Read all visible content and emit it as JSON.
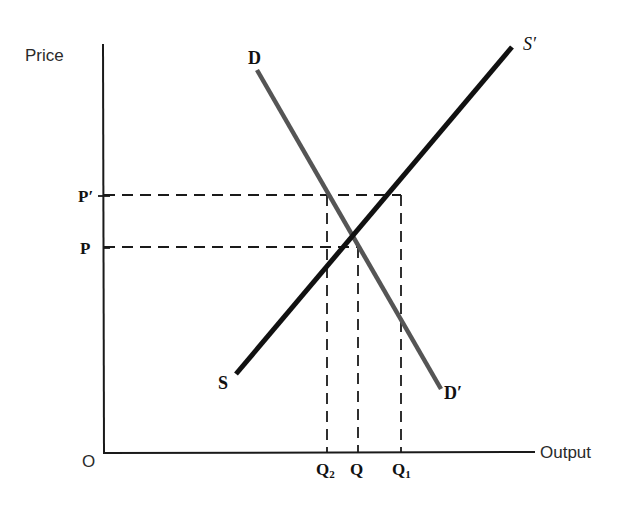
{
  "diagram": {
    "title": "",
    "axes": {
      "y_label": "Price",
      "x_label": "Output",
      "origin_label": "O"
    },
    "price_levels": [
      {
        "id": "p_prime",
        "label": "P′",
        "y": 195
      },
      {
        "id": "p",
        "label": "P",
        "y": 247
      }
    ],
    "quantity_levels": [
      {
        "id": "q2",
        "label": "Q",
        "subscript": "2",
        "x": 327
      },
      {
        "id": "q",
        "label": "Q",
        "subscript": "",
        "x": 358
      },
      {
        "id": "q1",
        "label": "Q",
        "subscript": "1",
        "x": 401
      }
    ],
    "curves": {
      "demand": {
        "start_label": "D",
        "end_label": "D′",
        "color": "#555555"
      },
      "supply": {
        "start_label": "S",
        "end_label": "S′",
        "color": "#111111"
      }
    },
    "equilibrium": {
      "price": "P",
      "quantity": "Q"
    },
    "colors": {
      "axis": "#1a1a1a",
      "dashed": "#1a1a1a",
      "demand": "#555555",
      "supply": "#111111",
      "background": "#ffffff"
    }
  }
}
